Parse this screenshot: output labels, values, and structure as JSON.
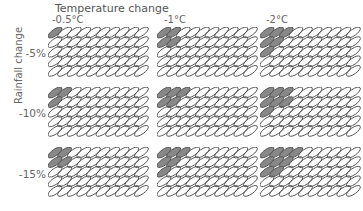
{
  "title": "Temperature change",
  "y_axis_label": "Rainfall change",
  "columns": [
    {
      "label": "-0.5°C"
    },
    {
      "label": "-1°C"
    },
    {
      "label": "-2°C"
    }
  ],
  "rows": [
    {
      "label": "-5%"
    },
    {
      "label": "-10%"
    },
    {
      "label": "-15%"
    }
  ],
  "grid_shape": {
    "cols": 10,
    "rows": 5
  },
  "colors": {
    "filled": "#888888",
    "outline": "#555555",
    "empty": "#ffffff"
  },
  "filled_counts_per_row": [
    [
      [
        1,
        0,
        0,
        0,
        0
      ],
      [
        2,
        2,
        0,
        0,
        0
      ],
      [
        3,
        2,
        1,
        0,
        0
      ]
    ],
    [
      [
        2,
        1,
        0,
        0,
        0
      ],
      [
        3,
        2,
        0,
        0,
        0
      ],
      [
        3,
        3,
        1,
        0,
        0
      ]
    ],
    [
      [
        2,
        2,
        0,
        0,
        0
      ],
      [
        3,
        2,
        1,
        0,
        0
      ],
      [
        4,
        3,
        2,
        0,
        0
      ]
    ]
  ]
}
